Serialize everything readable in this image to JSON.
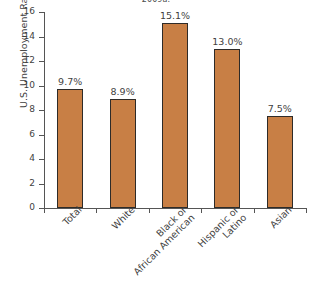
{
  "chart_data": {
    "type": "bar",
    "title": "2009a.",
    "xlabel": "",
    "ylabel": "U.S. Unemployment Rates",
    "ylim": [
      0,
      16
    ],
    "yticks": [
      "0",
      "2",
      "4",
      "6",
      "8",
      "10",
      "12",
      "14",
      "16"
    ],
    "grid": false,
    "legend": null,
    "categories": [
      "Total",
      "White",
      "Black or\nAfrican American",
      "Hispanic or\nLatino",
      "Asian"
    ],
    "category_lines": [
      [
        "Total"
      ],
      [
        "White"
      ],
      [
        "Black or",
        "African American"
      ],
      [
        "Hispanic or",
        "Latino"
      ],
      [
        "Asian"
      ]
    ],
    "values": [
      9.7,
      8.9,
      15.1,
      13.0,
      7.5
    ],
    "data_labels": [
      "9.7%",
      "8.9%",
      "15.1%",
      "13.0%",
      "7.5%"
    ],
    "bar_color": "#c87f45",
    "bar_edge_color": "#2e2b28",
    "axis_color": "#555555",
    "text_color": "#3f3f3f"
  }
}
